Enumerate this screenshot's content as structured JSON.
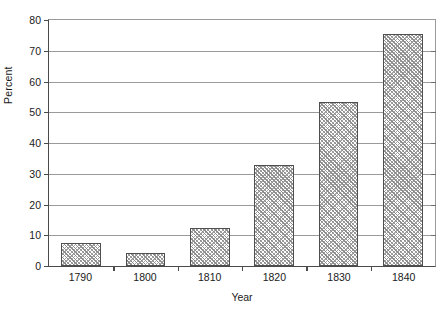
{
  "chart_data": {
    "type": "bar",
    "title": "",
    "xlabel": "Year",
    "ylabel": "Percent",
    "categories": [
      "1790",
      "1800",
      "1810",
      "1820",
      "1830",
      "1840"
    ],
    "values": [
      7.5,
      4.3,
      12.3,
      32.8,
      53.5,
      75.5
    ],
    "ylim": [
      0,
      80
    ],
    "ytick_step": 10,
    "yticks": [
      "0",
      "10",
      "20",
      "30",
      "40",
      "50",
      "60",
      "70",
      "80"
    ],
    "grid": true,
    "grid_axis": "y",
    "legend": false,
    "legend_position": "none",
    "series": [
      {
        "name": "Percent",
        "values": [
          7.5,
          4.3,
          12.3,
          32.8,
          53.5,
          75.5
        ]
      }
    ],
    "annotations": []
  },
  "style": {
    "bar_border_color": "#4f4f4f",
    "bar_fill_pattern": "diagonal-crosshatch",
    "bar_fill_color": "#9a9a9a",
    "gridline_color": "#9a9a9a",
    "axis_color": "#4a4a4a",
    "text_color": "#1a1a1a",
    "background_color": "#ffffff"
  }
}
